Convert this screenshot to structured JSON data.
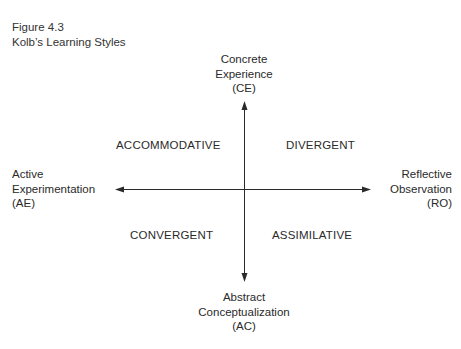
{
  "figure": {
    "number": "Figure 4.3",
    "title": "Kolb’s Learning Styles"
  },
  "axes": {
    "top": {
      "line1": "Concrete",
      "line2": "Experience",
      "line3": "(CE)"
    },
    "bottom": {
      "line1": "Abstract",
      "line2": "Conceptualization",
      "line3": "(AC)"
    },
    "left": {
      "line1": "Active",
      "line2": "Experimentation",
      "line3": "(AE)"
    },
    "right": {
      "line1": "Reflective",
      "line2": "Observation",
      "line3": "(RO)"
    }
  },
  "quadrants": {
    "top_left": "ACCOMMODATIVE",
    "top_right": "DIVERGENT",
    "bottom_left": "CONVERGENT",
    "bottom_right": "ASSIMILATIVE"
  },
  "colors": {
    "line": "#2a2a2a",
    "text": "#2a2a2a",
    "background": "#ffffff"
  }
}
